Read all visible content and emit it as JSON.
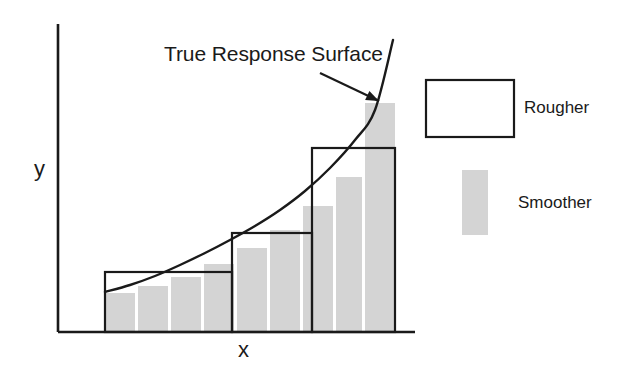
{
  "figure": {
    "annotation": "True Response Surface",
    "x_axis_label": "x",
    "y_axis_label": "y",
    "colors": {
      "line": "#1a1a1a",
      "axis": "#1a1a1a",
      "rough_fill": "#ffffff",
      "rough_stroke": "#1a1a1a",
      "smooth_fill": "#d4d4d4",
      "text": "#1a1a1a",
      "background": "#ffffff"
    }
  },
  "legend": {
    "items": [
      {
        "label": "Rougher",
        "swatch": "open-rectangle"
      },
      {
        "label": "Smoother",
        "swatch": "gray-rectangle"
      }
    ]
  },
  "chart_data": {
    "type": "bar",
    "title": "",
    "annotations": [
      {
        "text": "True Response Surface",
        "text_x": 164,
        "text_y": 55,
        "arrow_from_x": 320,
        "arrow_from_y": 73,
        "arrow_to_x": 379,
        "arrow_to_y": 101
      }
    ],
    "xlabel": "x",
    "ylabel": "y",
    "grid": false,
    "legend_position": "right",
    "axes": {
      "x_axis_y": 332,
      "x_axis_x0": 58,
      "x_axis_x1": 415,
      "y_axis_x": 58,
      "y_axis_y0": 24,
      "y_axis_y1": 332
    },
    "true_curve": {
      "name": "True Response Surface",
      "description": "smooth increasing convex curve",
      "points_px": [
        [
          105,
          292
        ],
        [
          130,
          285
        ],
        [
          155,
          276
        ],
        [
          180,
          265
        ],
        [
          205,
          253
        ],
        [
          230,
          240
        ],
        [
          255,
          226
        ],
        [
          280,
          210
        ],
        [
          305,
          191
        ],
        [
          330,
          168
        ],
        [
          355,
          140
        ],
        [
          375,
          110
        ],
        [
          393,
          40
        ]
      ]
    },
    "series": [
      {
        "name": "Rougher",
        "style": "open-step-rectangles",
        "bars_px": [
          {
            "x0": 105,
            "x1": 232,
            "top": 272,
            "bottom": 332
          },
          {
            "x0": 232,
            "x1": 312,
            "top": 233,
            "bottom": 332
          },
          {
            "x0": 312,
            "x1": 395,
            "top": 148,
            "bottom": 332
          }
        ]
      },
      {
        "name": "Smoother",
        "style": "filled-narrow-bars",
        "bars_px": [
          {
            "x0": 105,
            "x1": 135,
            "top": 293,
            "bottom": 332
          },
          {
            "x0": 138,
            "x1": 168,
            "top": 286,
            "bottom": 332
          },
          {
            "x0": 171,
            "x1": 201,
            "top": 277,
            "bottom": 332
          },
          {
            "x0": 204,
            "x1": 234,
            "top": 264,
            "bottom": 332
          },
          {
            "x0": 237,
            "x1": 267,
            "top": 248,
            "bottom": 332
          },
          {
            "x0": 270,
            "x1": 300,
            "top": 230,
            "bottom": 332
          },
          {
            "x0": 303,
            "x1": 333,
            "top": 206,
            "bottom": 332
          },
          {
            "x0": 336,
            "x1": 362,
            "top": 177,
            "bottom": 332
          },
          {
            "x0": 365,
            "x1": 395,
            "top": 103,
            "bottom": 332
          }
        ]
      }
    ]
  },
  "legend_geometry": {
    "rougher_box": {
      "x": 426,
      "y": 80,
      "w": 88,
      "h": 57
    },
    "smoother_box": {
      "x": 462,
      "y": 170,
      "w": 26,
      "h": 65
    }
  }
}
